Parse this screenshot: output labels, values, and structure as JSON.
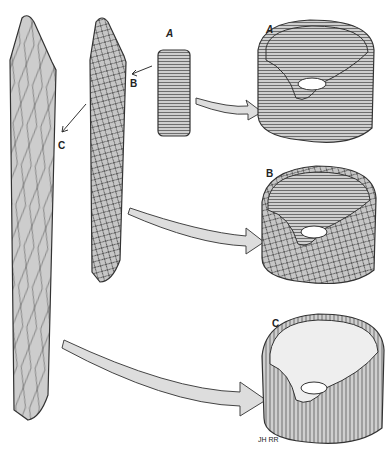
{
  "figure": {
    "labels": {
      "small_A": "A",
      "small_B": "B",
      "small_C": "C",
      "large_A": "A",
      "large_B": "B",
      "large_C": "C",
      "signature": "JH RR"
    },
    "colors": {
      "fill": "#c8c8c8",
      "stroke": "#333333",
      "arrow_fill": "#dcdcdc"
    }
  }
}
